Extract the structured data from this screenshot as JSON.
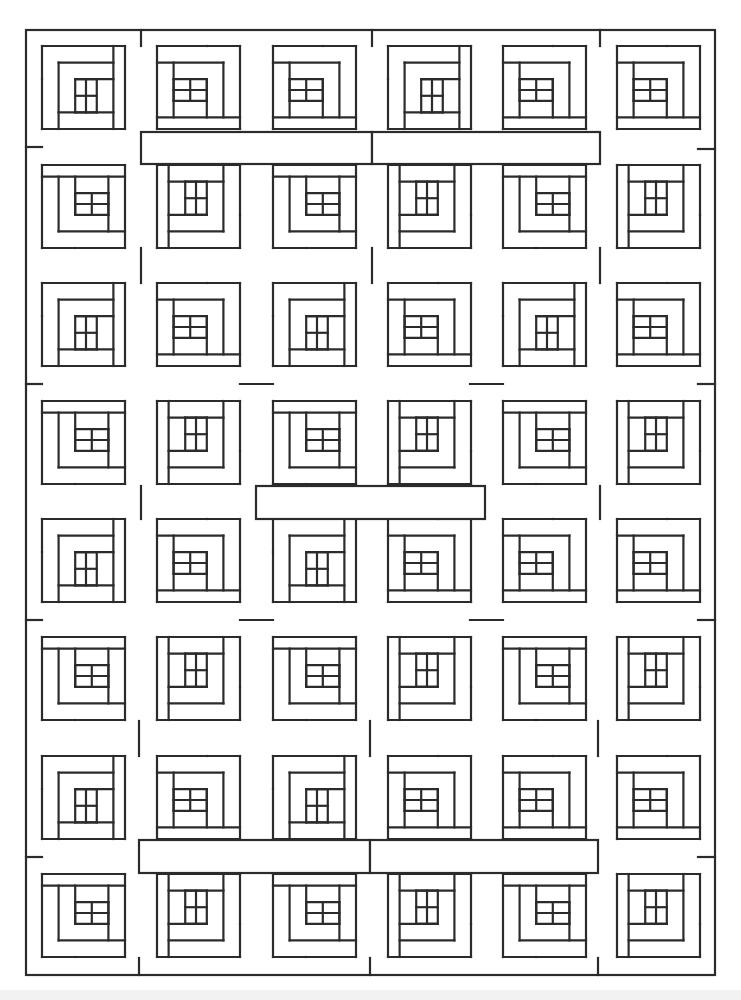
{
  "page": {
    "background": "#ffffff",
    "line_color": "#2b2b2b"
  },
  "frame": {
    "x": 26,
    "y": 30,
    "w": 689,
    "h": 945
  },
  "grid": {
    "block_size": 83,
    "cols_x": [
      42,
      157,
      273,
      388,
      503,
      617
    ],
    "rows_y": [
      46,
      165,
      283,
      401,
      519,
      637,
      756,
      874
    ]
  },
  "blocks_rot": [
    [
      0,
      1,
      1,
      0,
      1,
      1
    ],
    [
      3,
      2,
      3,
      2,
      3,
      2
    ],
    [
      0,
      1,
      0,
      1,
      0,
      1
    ],
    [
      3,
      2,
      3,
      2,
      3,
      2
    ],
    [
      0,
      1,
      0,
      1,
      1,
      1
    ],
    [
      3,
      2,
      3,
      2,
      3,
      2
    ],
    [
      0,
      1,
      0,
      1,
      1,
      1
    ],
    [
      3,
      2,
      3,
      2,
      3,
      2
    ]
  ],
  "sashes": [
    {
      "x": 141,
      "y": 132,
      "w": 231,
      "h": 32
    },
    {
      "x": 372,
      "y": 132,
      "w": 228,
      "h": 32
    },
    {
      "x": 256,
      "y": 486,
      "w": 229,
      "h": 33
    },
    {
      "x": 139,
      "y": 840,
      "w": 231,
      "h": 33
    },
    {
      "x": 370,
      "y": 840,
      "w": 228,
      "h": 33
    }
  ],
  "frame_ticks": [
    {
      "x1": 141,
      "y1": 30,
      "x2": 141,
      "y2": 46
    },
    {
      "x1": 372,
      "y1": 30,
      "x2": 372,
      "y2": 46
    },
    {
      "x1": 600,
      "y1": 30,
      "x2": 600,
      "y2": 46
    },
    {
      "x1": 26,
      "y1": 147,
      "x2": 42,
      "y2": 147
    },
    {
      "x1": 698,
      "y1": 149,
      "x2": 715,
      "y2": 149
    },
    {
      "x1": 26,
      "y1": 384,
      "x2": 42,
      "y2": 384
    },
    {
      "x1": 698,
      "y1": 384,
      "x2": 715,
      "y2": 384
    },
    {
      "x1": 26,
      "y1": 620,
      "x2": 42,
      "y2": 620
    },
    {
      "x1": 698,
      "y1": 620,
      "x2": 715,
      "y2": 620
    },
    {
      "x1": 26,
      "y1": 857,
      "x2": 42,
      "y2": 857
    },
    {
      "x1": 698,
      "y1": 857,
      "x2": 715,
      "y2": 857
    },
    {
      "x1": 139,
      "y1": 958,
      "x2": 139,
      "y2": 975
    },
    {
      "x1": 370,
      "y1": 958,
      "x2": 370,
      "y2": 975
    },
    {
      "x1": 598,
      "y1": 958,
      "x2": 598,
      "y2": 975
    }
  ],
  "horizontal_links": [
    {
      "x1": 141,
      "y1": 248,
      "x2": 141,
      "y2": 283
    },
    {
      "x1": 372,
      "y1": 248,
      "x2": 372,
      "y2": 283
    },
    {
      "x1": 600,
      "y1": 248,
      "x2": 600,
      "y2": 283
    },
    {
      "x1": 240,
      "y1": 384,
      "x2": 273,
      "y2": 384
    },
    {
      "x1": 470,
      "y1": 384,
      "x2": 503,
      "y2": 384
    },
    {
      "x1": 141,
      "y1": 486,
      "x2": 141,
      "y2": 519
    },
    {
      "x1": 600,
      "y1": 486,
      "x2": 600,
      "y2": 519
    },
    {
      "x1": 240,
      "y1": 620,
      "x2": 273,
      "y2": 620
    },
    {
      "x1": 470,
      "y1": 620,
      "x2": 503,
      "y2": 620
    },
    {
      "x1": 139,
      "y1": 721,
      "x2": 139,
      "y2": 756
    },
    {
      "x1": 370,
      "y1": 721,
      "x2": 370,
      "y2": 756
    },
    {
      "x1": 598,
      "y1": 721,
      "x2": 598,
      "y2": 756
    }
  ]
}
